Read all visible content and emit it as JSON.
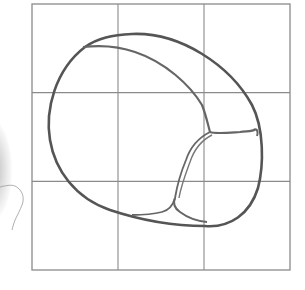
{
  "figure": {
    "grid": {
      "rows": 3,
      "columns": 3
    },
    "colors": {
      "grid_line": "#8a8a8a",
      "outline": "#555555",
      "contour": "#666666",
      "sketch_mark": "#9a9a9a",
      "background": "#ffffff"
    }
  }
}
